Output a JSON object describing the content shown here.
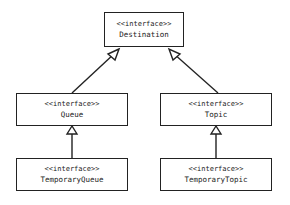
{
  "diagram": {
    "type": "UML interface hierarchy",
    "nodes": [
      {
        "id": "destination",
        "stereotype": "<<interface>>",
        "name": "Destination"
      },
      {
        "id": "queue",
        "stereotype": "<<interface>>",
        "name": "Queue"
      },
      {
        "id": "topic",
        "stereotype": "<<interface>>",
        "name": "Topic"
      },
      {
        "id": "temporary_queue",
        "stereotype": "<<interface>>",
        "name": "TemporaryQueue"
      },
      {
        "id": "temporary_topic",
        "stereotype": "<<interface>>",
        "name": "TemporaryTopic"
      }
    ],
    "edges": [
      {
        "from": "queue",
        "to": "destination",
        "kind": "generalization"
      },
      {
        "from": "topic",
        "to": "destination",
        "kind": "generalization"
      },
      {
        "from": "temporary_queue",
        "to": "queue",
        "kind": "generalization"
      },
      {
        "from": "temporary_topic",
        "to": "topic",
        "kind": "generalization"
      }
    ]
  }
}
